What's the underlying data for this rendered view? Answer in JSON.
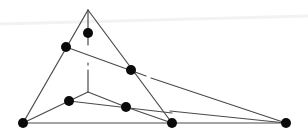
{
  "diagram": {
    "type": "geometric-graph",
    "colors": {
      "edge": "#4a4a4a",
      "node": "#0a0a0a",
      "background": "#ffffff"
    },
    "node_radius": 5,
    "nodes": [
      {
        "id": "apex",
        "x": 88,
        "y": 10,
        "dot": false
      },
      {
        "id": "upper-inner",
        "x": 88,
        "y": 33,
        "dot": true
      },
      {
        "id": "left-edge",
        "x": 66,
        "y": 47,
        "dot": true
      },
      {
        "id": "right-edge",
        "x": 131,
        "y": 70,
        "dot": true
      },
      {
        "id": "center",
        "x": 88,
        "y": 78,
        "dot": false
      },
      {
        "id": "lower-left-inner",
        "x": 69,
        "y": 101,
        "dot": true
      },
      {
        "id": "lower-mid-inner",
        "x": 126,
        "y": 107,
        "dot": true
      },
      {
        "id": "bottom-left",
        "x": 23,
        "y": 123,
        "dot": true
      },
      {
        "id": "bottom-mid",
        "x": 172,
        "y": 123,
        "dot": true
      },
      {
        "id": "bottom-right",
        "x": 286,
        "y": 123,
        "dot": true
      }
    ],
    "edges": [
      {
        "x1": 88,
        "y1": 10,
        "x2": 23,
        "y2": 123
      },
      {
        "x1": 88,
        "y1": 10,
        "x2": 172,
        "y2": 123
      },
      {
        "x1": 23,
        "y1": 123,
        "x2": 286,
        "y2": 123
      },
      {
        "x1": 88,
        "y1": 10,
        "x2": 88,
        "y2": 45
      },
      {
        "x1": 66,
        "y1": 47,
        "x2": 146,
        "y2": 76
      },
      {
        "x1": 151,
        "y1": 78,
        "x2": 286,
        "y2": 123
      },
      {
        "x1": 88,
        "y1": 63,
        "x2": 88,
        "y2": 65
      },
      {
        "x1": 88,
        "y1": 70,
        "x2": 88,
        "y2": 92
      },
      {
        "x1": 88,
        "y1": 92,
        "x2": 69,
        "y2": 101
      },
      {
        "x1": 88,
        "y1": 92,
        "x2": 126,
        "y2": 107
      },
      {
        "x1": 23,
        "y1": 123,
        "x2": 69,
        "y2": 101
      },
      {
        "x1": 69,
        "y1": 101,
        "x2": 172,
        "y2": 113
      },
      {
        "x1": 126,
        "y1": 107,
        "x2": 172,
        "y2": 123
      },
      {
        "x1": 170,
        "y1": 111,
        "x2": 286,
        "y2": 123
      }
    ]
  }
}
